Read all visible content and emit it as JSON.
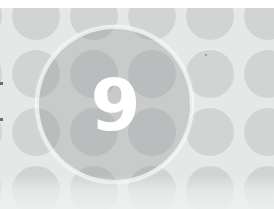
{
  "page": {
    "width": 274,
    "height": 209
  },
  "numeral": {
    "value": "9",
    "color": "#ffffff",
    "description": "bold white numeral centered in the highlight circle"
  },
  "highlight_circle": {
    "name": "big-circle",
    "center_x": 114,
    "center_y": 96,
    "radius": 78,
    "fill": "rgba(120,122,124,0.26)",
    "ring_color": "#fafafa"
  },
  "background": {
    "base_color": "#e3e4e4",
    "top_strip_color": "#ffffff",
    "bottom_wash_color": "#eeefef"
  },
  "dot_pattern": {
    "dot_color": "#d2d4d4",
    "dot_diameter": 48,
    "pitch_x": 58,
    "pitch_y": 58,
    "offset_x": 7,
    "offset_y": 3,
    "columns": 6,
    "rows": 5
  },
  "marks": {
    "edge_mark_color": "#6b6c6d",
    "speck_color": "#8d8f90"
  }
}
